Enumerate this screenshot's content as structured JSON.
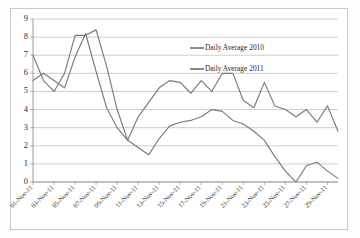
{
  "chart_data": {
    "type": "line",
    "title": "",
    "xlabel": "",
    "ylabel": "",
    "ylim": [
      0,
      9
    ],
    "ytick_labels": [
      "0",
      "1",
      "2",
      "3",
      "4",
      "5",
      "6",
      "7",
      "8",
      "9"
    ],
    "yticks": [
      0,
      1,
      2,
      3,
      4,
      5,
      6,
      7,
      8,
      9
    ],
    "grid": true,
    "legend_position": "upper-right-inside",
    "x": [
      "01-Nov-11",
      "02-Nov-11",
      "03-Nov-11",
      "04-Nov-11",
      "05-Nov-11",
      "06-Nov-11",
      "07-Nov-11",
      "08-Nov-11",
      "09-Nov-11",
      "10-Nov-11",
      "11-Nov-11",
      "12-Nov-11",
      "13-Nov-11",
      "14-Nov-11",
      "15-Nov-11",
      "16-Nov-11",
      "17-Nov-11",
      "18-Nov-11",
      "19-Nov-11",
      "20-Nov-11",
      "21-Nov-11",
      "22-Nov-11",
      "23-Nov-11",
      "24-Nov-11",
      "25-Nov-11",
      "26-Nov-11",
      "27-Nov-11",
      "28-Nov-11",
      "29-Nov-11",
      "30-Nov-11"
    ],
    "x_tick_labels": [
      "01-Nov-11",
      "03-Nov-11",
      "05-Nov-11",
      "07-Nov-11",
      "09-Nov-11",
      "11-Nov-11",
      "13-Nov-11",
      "15-Nov-11",
      "17-Nov-11",
      "19-Nov-11",
      "21-Nov-11",
      "23-Nov-11",
      "25-Nov-11",
      "27-Nov-11",
      "29-Nov-11"
    ],
    "series": [
      {
        "name": "Daily Average 2010",
        "color": "#7a7a7a",
        "values": [
          7.0,
          5.6,
          5.0,
          6.0,
          8.1,
          8.1,
          8.4,
          6.4,
          4.0,
          2.3,
          3.6,
          4.4,
          5.2,
          5.6,
          5.5,
          4.9,
          5.6,
          5.0,
          6.0,
          6.0,
          4.5,
          4.1,
          5.5,
          4.2,
          4.0,
          3.6,
          4.0,
          3.3,
          4.2,
          2.8
        ]
      },
      {
        "name": "Daily Average 2011",
        "color": "#7a7a7a",
        "values": [
          5.6,
          6.0,
          5.6,
          5.2,
          6.9,
          8.2,
          6.1,
          4.1,
          3.0,
          2.3,
          1.9,
          1.5,
          2.4,
          3.1,
          3.3,
          3.4,
          3.6,
          4.0,
          3.9,
          3.4,
          3.2,
          2.8,
          2.3,
          1.4,
          0.6,
          0.0,
          0.9,
          1.1,
          0.6,
          0.2
        ]
      }
    ],
    "legend": [
      {
        "label": "Daily Average 2010"
      },
      {
        "label": "Daily Average 2011"
      }
    ]
  },
  "layout": {
    "plot_left": 33,
    "plot_right": 338,
    "plot_top": 19,
    "plot_bottom": 182
  }
}
